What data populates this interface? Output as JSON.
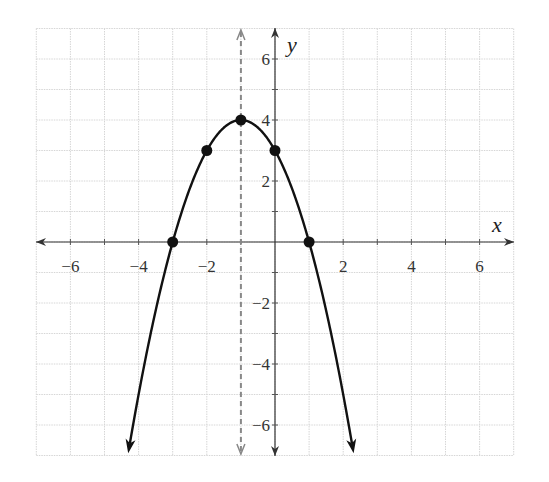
{
  "chart_data": {
    "type": "line",
    "title": "",
    "xlabel": "x",
    "ylabel": "y",
    "xlim": [
      -7,
      7
    ],
    "ylim": [
      -7,
      7
    ],
    "grid": true,
    "x_ticks": [
      -6,
      -4,
      -2,
      2,
      4,
      6
    ],
    "y_ticks": [
      -6,
      -4,
      -2,
      2,
      4,
      6
    ],
    "x_tick_labels": [
      "−6",
      "−4",
      "−2",
      "2",
      "4",
      "6"
    ],
    "y_tick_labels": [
      "−6",
      "−4",
      "−2",
      "2",
      "4",
      "6"
    ],
    "series": [
      {
        "name": "parabola y = -(x+1)^2 + 4",
        "points": [
          [
            -3,
            0
          ],
          [
            -2,
            3
          ],
          [
            -1,
            4
          ],
          [
            0,
            3
          ],
          [
            1,
            0
          ]
        ],
        "extends_with_arrows": true,
        "color": "#111111"
      }
    ],
    "annotations": [
      {
        "type": "axis_of_symmetry",
        "x": -1,
        "style": "dashed",
        "color": "#888888"
      }
    ],
    "legend": null
  }
}
